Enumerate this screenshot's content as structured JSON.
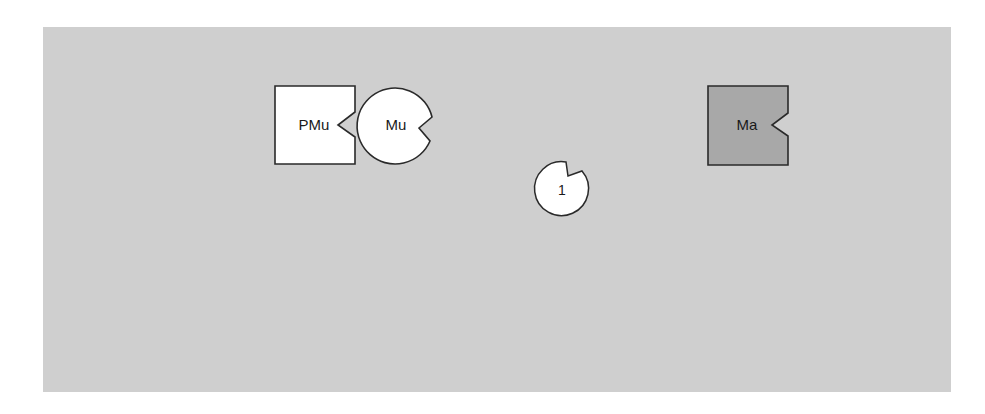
{
  "diagram": {
    "background_color": "#cfcfcf",
    "stroke_color": "#2a2a2a",
    "shapes": [
      {
        "id": "pmu",
        "label": "PMu",
        "kind": "square-with-notch",
        "fill": "#ffffff",
        "notch_side": "right"
      },
      {
        "id": "mu",
        "label": "Mu",
        "kind": "circle-with-notch",
        "fill": "#ffffff",
        "notch_side": "right"
      },
      {
        "id": "one",
        "label": "1",
        "kind": "circle-with-notch",
        "fill": "#ffffff",
        "notch_side": "top-right"
      },
      {
        "id": "ma",
        "label": "Ma",
        "kind": "square-with-notch",
        "fill": "#a8a8a8",
        "notch_side": "right"
      }
    ]
  }
}
